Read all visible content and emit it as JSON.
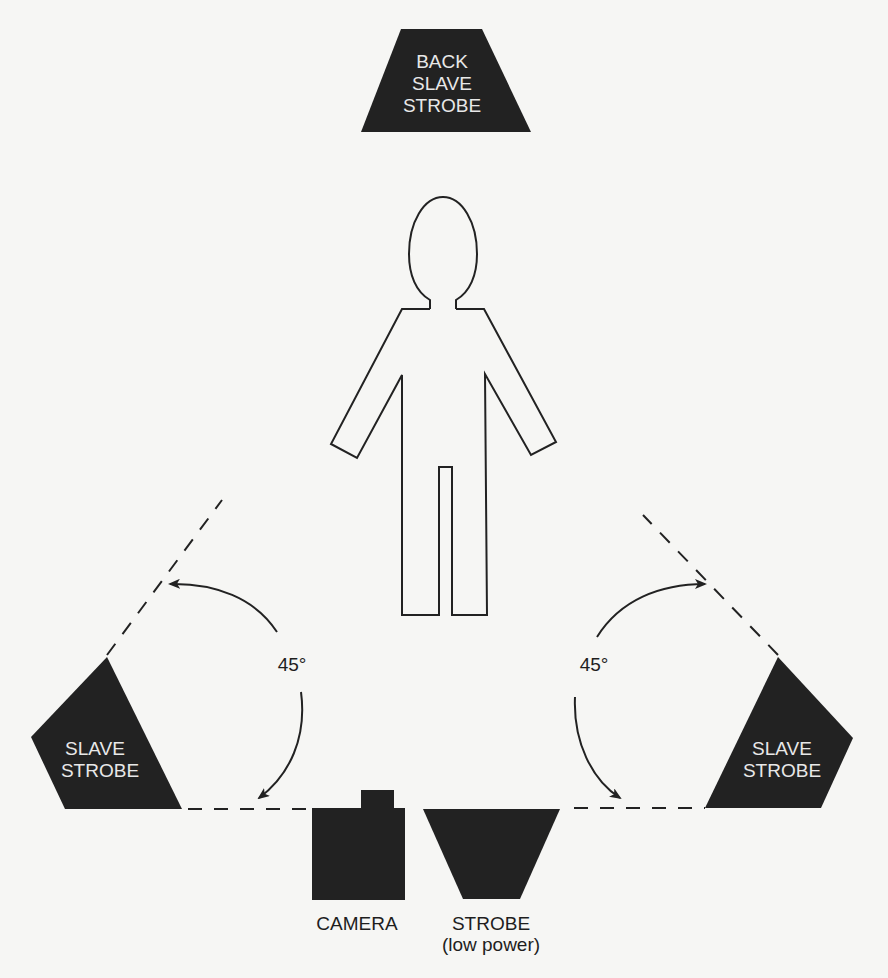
{
  "diagram": {
    "colors": {
      "shape_fill": "#222222",
      "background": "#f6f6f4",
      "line": "#222222",
      "inside_text": "#e8e8e8"
    },
    "back_strobe": {
      "lines": [
        "BACK",
        "SLAVE",
        "STROBE"
      ]
    },
    "subject": {
      "label": "subject-figure"
    },
    "left_slave_strobe": {
      "lines": [
        "SLAVE",
        "STROBE"
      ],
      "angle": "45°"
    },
    "right_slave_strobe": {
      "lines": [
        "SLAVE",
        "STROBE"
      ],
      "angle": "45°"
    },
    "camera": {
      "label": "CAMERA"
    },
    "front_strobe": {
      "label": "STROBE",
      "sublabel": "(low power)"
    }
  }
}
